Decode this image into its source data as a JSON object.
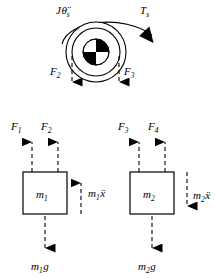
{
  "diagram": {
    "type": "free-body-diagram",
    "title_visible": false,
    "colors": {
      "stroke": "#000000",
      "fill_black": "#000000",
      "fill_white": "#ffffff",
      "background": "#ffffff"
    },
    "pulley": {
      "name": "pulley-sheave",
      "center": {
        "x": 96,
        "y": 52
      },
      "outer_radius": 30,
      "inner_radius": 24,
      "hub_radius": 13,
      "hub_quadrants": [
        {
          "position": "upper-left",
          "fill": "#ffffff"
        },
        {
          "position": "upper-right",
          "fill": "#000000"
        },
        {
          "position": "lower-left",
          "fill": "#000000"
        },
        {
          "position": "lower-right",
          "fill": "#ffffff"
        }
      ],
      "inertia_label": {
        "symbol": "J",
        "variable": "θ̈",
        "subscript": "s",
        "full": "Jθ̈s",
        "x": 56,
        "y": 14
      },
      "torque_label": {
        "symbol": "T",
        "subscript": "s",
        "full": "Ts",
        "x": 140,
        "y": 14
      },
      "arc_arrow": {
        "name": "torque-arc-arrow",
        "direction": "clockwise",
        "head_at": "right"
      }
    },
    "pulley_forces": [
      {
        "name": "force-F2-pulley",
        "label": "F",
        "subscript": "2",
        "full": "F2",
        "label_x": 54,
        "label_y": 74,
        "line_x": 72,
        "line_top": 56,
        "line_bottom": 92,
        "direction": "down"
      },
      {
        "name": "force-F3-pulley",
        "label": "F",
        "subscript": "3",
        "full": "F3",
        "label_x": 124,
        "label_y": 74,
        "line_x": 119,
        "line_top": 56,
        "line_bottom": 92,
        "direction": "down"
      }
    ],
    "masses": [
      {
        "name": "mass-block-m1",
        "label": "m",
        "subscript": "1",
        "full": "m1",
        "box": {
          "x": 23,
          "y": 172,
          "width": 44,
          "height": 42
        },
        "top_forces": [
          {
            "name": "force-F1",
            "label": "F",
            "subscript": "1",
            "full": "F1",
            "label_x": 14,
            "label_y": 127,
            "line_x": 32,
            "direction": "up"
          },
          {
            "name": "force-F2",
            "label": "F",
            "subscript": "2",
            "full": "F2",
            "label_x": 43,
            "label_y": 127,
            "line_x": 58,
            "direction": "up"
          }
        ],
        "inertia_force": {
          "name": "inertia-force-m1",
          "label": "m",
          "subscript": "1",
          "accel": "ẍ",
          "full": "m1ẍ",
          "label_x": 88,
          "label_y": 196,
          "line_x": 81,
          "direction": "up"
        },
        "weight": {
          "name": "weight-m1g",
          "label": "m",
          "subscript": "1",
          "suffix": "g",
          "full": "m1g",
          "label_x": 32,
          "label_y": 268,
          "line_x": 45,
          "direction": "down"
        }
      },
      {
        "name": "mass-block-m2",
        "label": "m",
        "subscript": "2",
        "full": "m2",
        "box": {
          "x": 130,
          "y": 172,
          "width": 44,
          "height": 42
        },
        "top_forces": [
          {
            "name": "force-F3",
            "label": "F",
            "subscript": "3",
            "full": "F3",
            "label_x": 121,
            "label_y": 127,
            "line_x": 139,
            "direction": "up"
          },
          {
            "name": "force-F4",
            "label": "F",
            "subscript": "4",
            "full": "F4",
            "label_x": 150,
            "label_y": 127,
            "line_x": 165,
            "direction": "up"
          }
        ],
        "inertia_force": {
          "name": "inertia-force-m2",
          "label": "m",
          "subscript": "2",
          "accel": "ẍ",
          "full": "m2ẍ",
          "label_x": 193,
          "label_y": 196,
          "line_x": 187,
          "direction": "down"
        },
        "weight": {
          "name": "weight-m2g",
          "label": "m",
          "subscript": "2",
          "suffix": "g",
          "full": "m2g",
          "label_x": 139,
          "label_y": 268,
          "line_x": 152,
          "direction": "down"
        }
      }
    ]
  }
}
